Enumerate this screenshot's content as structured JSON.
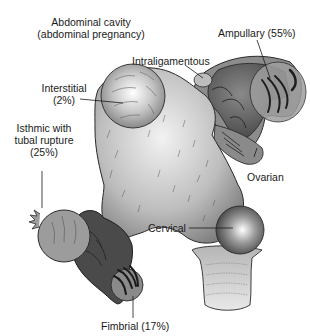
{
  "labels": {
    "abdominal_line1": "Abdominal cavity",
    "abdominal_line2": "(abdominal pregnancy)",
    "ampullary": "Ampullary (55%)",
    "intraligamentous": "Intraligamentous",
    "interstitial_line1": "Interstitial",
    "interstitial_line2": "(2%)",
    "isthmic_line1": "Isthmic with",
    "isthmic_line2": "tubal rupture",
    "isthmic_line3": "(25%)",
    "ovarian": "Ovarian",
    "cervical": "Cervical",
    "fimbrial": "Fimbrial (17%)"
  },
  "sites": [
    {
      "name": "Abdominal cavity",
      "percent": null
    },
    {
      "name": "Ampullary",
      "percent": 55
    },
    {
      "name": "Intraligamentous",
      "percent": null
    },
    {
      "name": "Interstitial",
      "percent": 2
    },
    {
      "name": "Isthmic with tubal rupture",
      "percent": 25
    },
    {
      "name": "Ovarian",
      "percent": null
    },
    {
      "name": "Cervical",
      "percent": null
    },
    {
      "name": "Fimbrial",
      "percent": 17
    }
  ],
  "colors": {
    "uterus_light": "#e6e6e6",
    "uterus_mid": "#9a9a9a",
    "tube_dark": "#4a4a4a",
    "outline": "#2a2a2a"
  }
}
